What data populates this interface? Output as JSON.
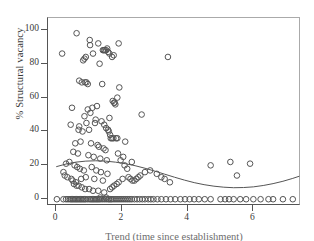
{
  "chart_data": {
    "type": "scatter",
    "title": "",
    "xlabel": "Trend (time since establishment)",
    "ylabel": "% Structural vacancy",
    "xlim": [
      -0.25,
      7.45
    ],
    "ylim": [
      -4,
      107
    ],
    "xticks": [
      0,
      2,
      4,
      6
    ],
    "yticks": [
      0,
      20,
      40,
      60,
      80,
      100
    ],
    "grid": false,
    "legend": null,
    "marker": "open-circle",
    "marker_color": "#555555",
    "fit_curve": {
      "name": "fitted quadratic trend line",
      "color": "#555555",
      "x": [
        0.0,
        0.3,
        0.6,
        0.9,
        1.2,
        1.5,
        1.8,
        2.1,
        2.4,
        2.7,
        3.0,
        3.3,
        3.6,
        3.9,
        4.2,
        4.5,
        4.8,
        5.1,
        5.4,
        5.7,
        6.0,
        6.3,
        6.6,
        6.9,
        7.2,
        7.4
      ],
      "y": [
        19.2,
        20.8,
        21.9,
        22.5,
        22.7,
        22.5,
        21.9,
        21.0,
        19.8,
        18.3,
        16.6,
        14.8,
        13.0,
        11.3,
        9.8,
        8.6,
        7.7,
        7.1,
        6.8,
        6.9,
        7.3,
        8.1,
        9.2,
        10.6,
        12.3,
        13.6
      ]
    },
    "points": [
      [
        0.18,
        86
      ],
      [
        0.62,
        98
      ],
      [
        1.02,
        94
      ],
      [
        1.03,
        91
      ],
      [
        1.28,
        92
      ],
      [
        1.42,
        88
      ],
      [
        1.45,
        88
      ],
      [
        1.48,
        88
      ],
      [
        1.52,
        88
      ],
      [
        1.55,
        89
      ],
      [
        1.58,
        87
      ],
      [
        1.62,
        86
      ],
      [
        1.7,
        84
      ],
      [
        1.75,
        85
      ],
      [
        1.9,
        92
      ],
      [
        0.9,
        84
      ],
      [
        0.82,
        82
      ],
      [
        0.86,
        83
      ],
      [
        1.12,
        86
      ],
      [
        1.32,
        80
      ],
      [
        0.7,
        70
      ],
      [
        0.78,
        69
      ],
      [
        0.88,
        69
      ],
      [
        0.92,
        69
      ],
      [
        0.96,
        68
      ],
      [
        1.4,
        68
      ],
      [
        1.92,
        66
      ],
      [
        1.86,
        60
      ],
      [
        1.72,
        58
      ],
      [
        1.76,
        57
      ],
      [
        1.78,
        57
      ],
      [
        1.8,
        56
      ],
      [
        0.48,
        54
      ],
      [
        0.96,
        53
      ],
      [
        1.04,
        51
      ],
      [
        1.1,
        54
      ],
      [
        1.24,
        55
      ],
      [
        0.86,
        49
      ],
      [
        1.2,
        47
      ],
      [
        1.62,
        48
      ],
      [
        2.6,
        50
      ],
      [
        3.4,
        84
      ],
      [
        0.44,
        44
      ],
      [
        0.7,
        43
      ],
      [
        0.92,
        45
      ],
      [
        1.18,
        45
      ],
      [
        1.38,
        46
      ],
      [
        1.46,
        44
      ],
      [
        0.68,
        41
      ],
      [
        0.8,
        40
      ],
      [
        1.0,
        41
      ],
      [
        1.52,
        42
      ],
      [
        1.58,
        41
      ],
      [
        1.6,
        40
      ],
      [
        1.64,
        38
      ],
      [
        1.66,
        36
      ],
      [
        1.7,
        36
      ],
      [
        1.74,
        36
      ],
      [
        1.82,
        36
      ],
      [
        1.86,
        36
      ],
      [
        0.58,
        33
      ],
      [
        0.74,
        34
      ],
      [
        1.06,
        33
      ],
      [
        1.26,
        32
      ],
      [
        1.3,
        31
      ],
      [
        1.44,
        30
      ],
      [
        1.5,
        29
      ],
      [
        2.1,
        34
      ],
      [
        0.52,
        28
      ],
      [
        0.66,
        27
      ],
      [
        0.98,
        26
      ],
      [
        1.14,
        25
      ],
      [
        1.34,
        24
      ],
      [
        1.54,
        23
      ],
      [
        2.3,
        22
      ],
      [
        0.3,
        21
      ],
      [
        0.4,
        22
      ],
      [
        0.56,
        20
      ],
      [
        0.64,
        19
      ],
      [
        0.72,
        18
      ],
      [
        0.84,
        17
      ],
      [
        1.08,
        19
      ],
      [
        1.22,
        17
      ],
      [
        1.36,
        16
      ],
      [
        1.56,
        15
      ],
      [
        0.22,
        16
      ],
      [
        0.26,
        14
      ],
      [
        0.34,
        13
      ],
      [
        0.46,
        12
      ],
      [
        0.5,
        11
      ],
      [
        0.6,
        10
      ],
      [
        0.76,
        12
      ],
      [
        0.9,
        13
      ],
      [
        1.16,
        12
      ],
      [
        1.42,
        11
      ],
      [
        0.54,
        9
      ],
      [
        0.62,
        8
      ],
      [
        0.68,
        8
      ],
      [
        0.78,
        7
      ],
      [
        0.88,
        6
      ],
      [
        1.0,
        6
      ],
      [
        1.12,
        5
      ],
      [
        1.28,
        5
      ],
      [
        1.46,
        4
      ],
      [
        1.64,
        6
      ],
      [
        1.7,
        7
      ],
      [
        1.76,
        8
      ],
      [
        1.84,
        9
      ],
      [
        1.9,
        10
      ],
      [
        2.02,
        12
      ],
      [
        2.2,
        13
      ],
      [
        2.26,
        12
      ],
      [
        2.32,
        11
      ],
      [
        2.38,
        11
      ],
      [
        2.44,
        12
      ],
      [
        2.5,
        13
      ],
      [
        2.56,
        14
      ],
      [
        2.7,
        16
      ],
      [
        2.86,
        17
      ],
      [
        3.06,
        15
      ],
      [
        3.2,
        13
      ],
      [
        3.3,
        12
      ],
      [
        3.46,
        10
      ],
      [
        2.08,
        20
      ],
      [
        2.16,
        18
      ],
      [
        1.96,
        23
      ],
      [
        2.04,
        25
      ],
      [
        1.88,
        27
      ],
      [
        4.7,
        20
      ],
      [
        5.3,
        22
      ],
      [
        5.9,
        21
      ],
      [
        5.5,
        14
      ],
      [
        1.34,
        1
      ],
      [
        1.52,
        1
      ],
      [
        0.02,
        0
      ],
      [
        0.22,
        0
      ],
      [
        0.3,
        0
      ],
      [
        0.36,
        0
      ],
      [
        0.42,
        0
      ],
      [
        0.46,
        0
      ],
      [
        0.5,
        0
      ],
      [
        0.54,
        0
      ],
      [
        0.58,
        0
      ],
      [
        0.62,
        0
      ],
      [
        0.66,
        0
      ],
      [
        0.7,
        0
      ],
      [
        0.74,
        0
      ],
      [
        0.78,
        0
      ],
      [
        0.82,
        0
      ],
      [
        0.86,
        0
      ],
      [
        0.9,
        0
      ],
      [
        0.96,
        0
      ],
      [
        1.02,
        0
      ],
      [
        1.06,
        0
      ],
      [
        1.1,
        0
      ],
      [
        1.14,
        0
      ],
      [
        1.18,
        0
      ],
      [
        1.22,
        0
      ],
      [
        1.26,
        0
      ],
      [
        1.3,
        0
      ],
      [
        1.34,
        0
      ],
      [
        1.4,
        0
      ],
      [
        1.46,
        0
      ],
      [
        1.52,
        0
      ],
      [
        1.58,
        0
      ],
      [
        1.62,
        0
      ],
      [
        1.66,
        0
      ],
      [
        1.7,
        0
      ],
      [
        1.76,
        0
      ],
      [
        1.82,
        0
      ],
      [
        1.88,
        0
      ],
      [
        1.94,
        0
      ],
      [
        2.0,
        0
      ],
      [
        2.06,
        0
      ],
      [
        2.12,
        0
      ],
      [
        2.18,
        0
      ],
      [
        2.24,
        0
      ],
      [
        2.3,
        0
      ],
      [
        2.38,
        0
      ],
      [
        2.46,
        0
      ],
      [
        2.54,
        0
      ],
      [
        2.62,
        0
      ],
      [
        2.7,
        0
      ],
      [
        2.8,
        0
      ],
      [
        2.88,
        0
      ],
      [
        2.96,
        0
      ],
      [
        3.08,
        0
      ],
      [
        3.2,
        0
      ],
      [
        3.34,
        0
      ],
      [
        3.48,
        0
      ],
      [
        3.62,
        0
      ],
      [
        3.78,
        0
      ],
      [
        3.92,
        0
      ],
      [
        4.06,
        0
      ],
      [
        4.2,
        0
      ],
      [
        4.34,
        0
      ],
      [
        4.52,
        0
      ],
      [
        4.7,
        0
      ],
      [
        5.0,
        0
      ],
      [
        5.14,
        0
      ],
      [
        5.26,
        0
      ],
      [
        5.4,
        0
      ],
      [
        5.6,
        0
      ],
      [
        5.78,
        0
      ],
      [
        6.0,
        0
      ],
      [
        6.22,
        0
      ],
      [
        6.46,
        0
      ],
      [
        6.6,
        0
      ],
      [
        6.9,
        0
      ],
      [
        7.2,
        0
      ]
    ]
  },
  "axes": {
    "ylabel_text": "% Structural vacancy",
    "xlabel_text": "Trend (time since establishment)",
    "ytick_labels": [
      "0",
      "20",
      "40",
      "60",
      "80",
      "100"
    ],
    "xtick_labels": [
      "0",
      "2",
      "4",
      "6"
    ]
  }
}
